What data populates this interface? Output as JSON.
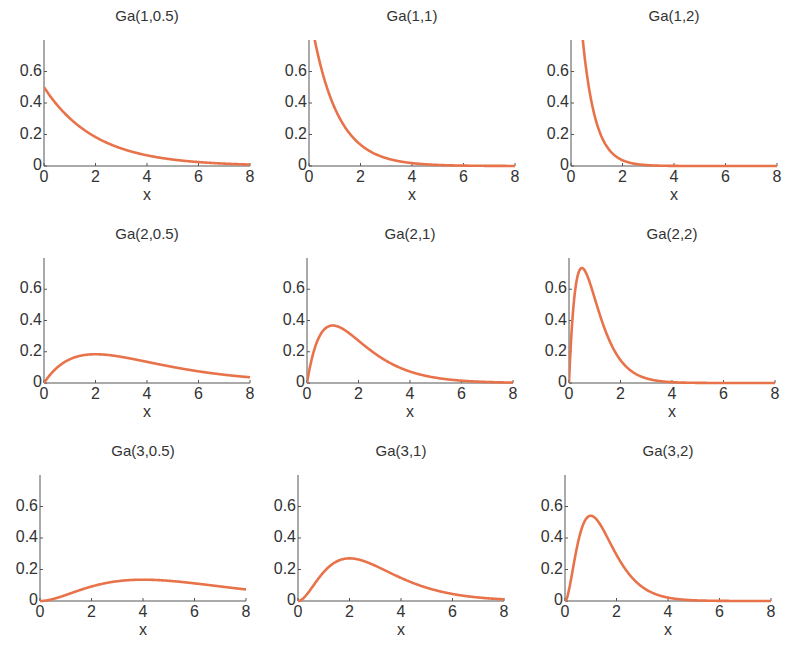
{
  "figure": {
    "curve_color": "#E8734A",
    "axis_color": "#555555"
  },
  "chart_data": [
    {
      "type": "line",
      "title": "Ga(1,0.5)",
      "shape": 1,
      "rate": 0.5,
      "xlabel": "x",
      "ylabel": "",
      "xlim": [
        0,
        8
      ],
      "ylim": [
        0,
        0.8
      ],
      "xticks": [
        "0",
        "2",
        "4",
        "6",
        "8"
      ],
      "yticks": [
        "0",
        "0.2",
        "0.4",
        "0.6"
      ],
      "grid": false,
      "x": [
        0,
        1,
        2,
        3,
        4,
        5,
        6,
        7,
        8
      ],
      "y": [
        0.5,
        0.303,
        0.184,
        0.112,
        0.068,
        0.041,
        0.025,
        0.015,
        0.009
      ]
    },
    {
      "type": "line",
      "title": "Ga(1,1)",
      "shape": 1,
      "rate": 1,
      "xlabel": "x",
      "ylabel": "",
      "xlim": [
        0,
        8
      ],
      "ylim": [
        0,
        0.8
      ],
      "xticks": [
        "0",
        "2",
        "4",
        "6",
        "8"
      ],
      "yticks": [
        "0",
        "0.2",
        "0.4",
        "0.6"
      ],
      "grid": false,
      "x": [
        0,
        1,
        2,
        3,
        4,
        5,
        6,
        7,
        8
      ],
      "y": [
        1.0,
        0.368,
        0.135,
        0.05,
        0.018,
        0.007,
        0.002,
        0.001,
        0.0003
      ]
    },
    {
      "type": "line",
      "title": "Ga(1,2)",
      "shape": 1,
      "rate": 2,
      "xlabel": "x",
      "ylabel": "",
      "xlim": [
        0,
        8
      ],
      "ylim": [
        0,
        0.8
      ],
      "xticks": [
        "0",
        "2",
        "4",
        "6",
        "8"
      ],
      "yticks": [
        "0",
        "0.2",
        "0.4",
        "0.6"
      ],
      "grid": false,
      "x": [
        0,
        0.5,
        1,
        1.5,
        2,
        3,
        4,
        6,
        8
      ],
      "y": [
        2.0,
        0.736,
        0.271,
        0.1,
        0.037,
        0.005,
        0.0007,
        0.0,
        0.0
      ]
    },
    {
      "type": "line",
      "title": "Ga(2,0.5)",
      "shape": 2,
      "rate": 0.5,
      "xlabel": "x",
      "ylabel": "",
      "xlim": [
        0,
        8
      ],
      "ylim": [
        0,
        0.8
      ],
      "xticks": [
        "0",
        "2",
        "4",
        "6",
        "8"
      ],
      "yticks": [
        "0",
        "0.2",
        "0.4",
        "0.6"
      ],
      "grid": false,
      "x": [
        0,
        1,
        2,
        3,
        4,
        5,
        6,
        7,
        8
      ],
      "y": [
        0,
        0.152,
        0.184,
        0.167,
        0.135,
        0.103,
        0.075,
        0.053,
        0.037
      ]
    },
    {
      "type": "line",
      "title": "Ga(2,1)",
      "shape": 2,
      "rate": 1,
      "xlabel": "x",
      "ylabel": "",
      "xlim": [
        0,
        8
      ],
      "ylim": [
        0,
        0.8
      ],
      "xticks": [
        "0",
        "2",
        "4",
        "6",
        "8"
      ],
      "yticks": [
        "0",
        "0.2",
        "0.4",
        "0.6"
      ],
      "grid": false,
      "x": [
        0,
        1,
        2,
        3,
        4,
        5,
        6,
        7,
        8
      ],
      "y": [
        0,
        0.368,
        0.271,
        0.149,
        0.073,
        0.034,
        0.015,
        0.006,
        0.003
      ]
    },
    {
      "type": "line",
      "title": "Ga(2,2)",
      "shape": 2,
      "rate": 2,
      "xlabel": "x",
      "ylabel": "",
      "xlim": [
        0,
        8
      ],
      "ylim": [
        0,
        0.8
      ],
      "xticks": [
        "0",
        "2",
        "4",
        "6",
        "8"
      ],
      "yticks": [
        "0",
        "0.2",
        "0.4",
        "0.6"
      ],
      "grid": false,
      "x": [
        0,
        0.5,
        1,
        1.5,
        2,
        3,
        4,
        6,
        8
      ],
      "y": [
        0,
        0.736,
        0.541,
        0.299,
        0.147,
        0.03,
        0.005,
        0.0001,
        0.0
      ]
    },
    {
      "type": "line",
      "title": "Ga(3,0.5)",
      "shape": 3,
      "rate": 0.5,
      "xlabel": "x",
      "ylabel": "",
      "xlim": [
        0,
        8
      ],
      "ylim": [
        0,
        0.8
      ],
      "xticks": [
        "0",
        "2",
        "4",
        "6",
        "8"
      ],
      "yticks": [
        "0",
        "0.2",
        "0.4",
        "0.6"
      ],
      "grid": false,
      "x": [
        0,
        1,
        2,
        3,
        4,
        5,
        6,
        7,
        8
      ],
      "y": [
        0,
        0.038,
        0.092,
        0.126,
        0.135,
        0.128,
        0.112,
        0.092,
        0.073
      ]
    },
    {
      "type": "line",
      "title": "Ga(3,1)",
      "shape": 3,
      "rate": 1,
      "xlabel": "x",
      "ylabel": "",
      "xlim": [
        0,
        8
      ],
      "ylim": [
        0,
        0.8
      ],
      "xticks": [
        "0",
        "2",
        "4",
        "6",
        "8"
      ],
      "yticks": [
        "0",
        "0.2",
        "0.4",
        "0.6"
      ],
      "grid": false,
      "x": [
        0,
        1,
        2,
        3,
        4,
        5,
        6,
        7,
        8
      ],
      "y": [
        0,
        0.184,
        0.271,
        0.224,
        0.147,
        0.084,
        0.045,
        0.022,
        0.011
      ]
    },
    {
      "type": "line",
      "title": "Ga(3,2)",
      "shape": 3,
      "rate": 2,
      "xlabel": "x",
      "ylabel": "",
      "xlim": [
        0,
        8
      ],
      "ylim": [
        0,
        0.8
      ],
      "xticks": [
        "0",
        "2",
        "4",
        "6",
        "8"
      ],
      "yticks": [
        "0",
        "0.2",
        "0.4",
        "0.6"
      ],
      "grid": false,
      "x": [
        0,
        0.5,
        1,
        1.5,
        2,
        3,
        4,
        6,
        8
      ],
      "y": [
        0,
        0.368,
        0.541,
        0.448,
        0.293,
        0.089,
        0.021,
        0.0007,
        0.0
      ]
    }
  ]
}
